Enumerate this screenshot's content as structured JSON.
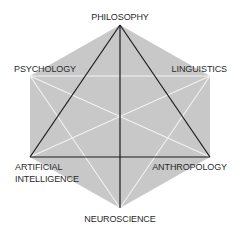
{
  "diagram": {
    "type": "cognitive-science-hexagon",
    "fill_color": "#c8c8c8",
    "strong_link_color": "#1a1a1a",
    "weak_link_color": "#f2f2f2",
    "nodes": [
      {
        "id": "philosophy",
        "label": "PHILOSOPHY",
        "x": 120,
        "y": 25
      },
      {
        "id": "psychology",
        "label": "PSYCHOLOGY",
        "x": 30,
        "y": 76
      },
      {
        "id": "linguistics",
        "label": "LINGUISTICS",
        "x": 210,
        "y": 76
      },
      {
        "id": "ai",
        "label_line1": "ARTIFICIAL",
        "label_line2": "INTELLIGENCE",
        "x": 30,
        "y": 157
      },
      {
        "id": "anthropology",
        "label": "ANTHROPOLOGY",
        "x": 210,
        "y": 157
      },
      {
        "id": "neuroscience",
        "label": "NEUROSCIENCE",
        "x": 120,
        "y": 208
      }
    ],
    "strong_links": [
      [
        "philosophy",
        "ai"
      ],
      [
        "philosophy",
        "anthropology"
      ],
      [
        "ai",
        "anthropology"
      ],
      [
        "philosophy",
        "neuroscience"
      ]
    ],
    "weak_links": [
      [
        "psychology",
        "linguistics"
      ],
      [
        "psychology",
        "anthropology"
      ],
      [
        "psychology",
        "neuroscience"
      ],
      [
        "linguistics",
        "ai"
      ],
      [
        "linguistics",
        "neuroscience"
      ],
      [
        "psychology",
        "ai"
      ],
      [
        "linguistics",
        "anthropology"
      ]
    ]
  }
}
